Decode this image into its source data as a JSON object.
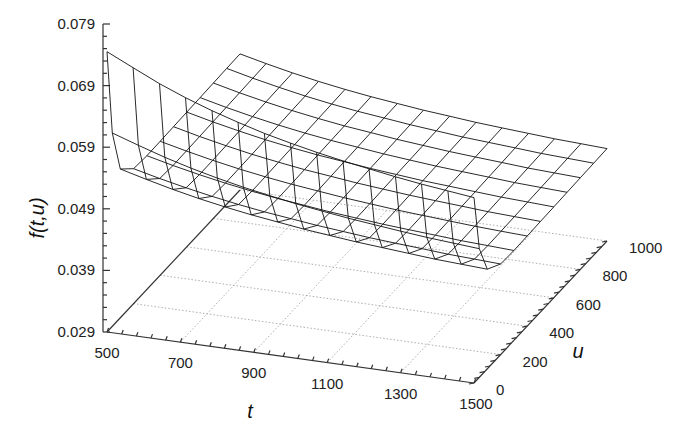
{
  "chart_data": {
    "type": "surface-wireframe",
    "title": "",
    "xlabel": "t",
    "ylabel": "u",
    "zlabel": "f(t,u)",
    "x_ticks": [
      500,
      700,
      900,
      1100,
      1300,
      1500
    ],
    "y_ticks": [
      0,
      200,
      400,
      600,
      800,
      1000
    ],
    "z_ticks": [
      "0.029",
      "0.039",
      "0.049",
      "0.059",
      "0.069",
      "0.079"
    ],
    "xlim": [
      500,
      1500
    ],
    "ylim": [
      0,
      1000
    ],
    "zlim": [
      0.029,
      0.079
    ],
    "grid": true,
    "t": [
      500,
      571,
      643,
      714,
      786,
      857,
      929,
      1000,
      1071,
      1143,
      1214,
      1286,
      1357,
      1429,
      1500
    ],
    "u": [
      0,
      40,
      100,
      200,
      300,
      400,
      500,
      600,
      700,
      800,
      900,
      1000
    ],
    "z_description": "f decreases with t; sharp rise as u approaches 0, nearly flat for u >= 200",
    "z_at_u0": [
      0.0745,
      0.0725,
      0.0705,
      0.0688,
      0.0673,
      0.066,
      0.0648,
      0.0638,
      0.0629,
      0.0621,
      0.0614,
      0.0607,
      0.0601,
      0.0596,
      0.0591
    ],
    "z_at_u_large": [
      0.0505,
      0.0495,
      0.0486,
      0.0478,
      0.0471,
      0.0465,
      0.046,
      0.0455,
      0.0451,
      0.0447,
      0.0444,
      0.0441,
      0.0438,
      0.0436,
      0.0434
    ]
  },
  "projection": {
    "origin": [
      107,
      332
    ],
    "t_axis_end": [
      474,
      383
    ],
    "u_axis_end": [
      240,
      190
    ],
    "z_px_per_unit": 6160
  }
}
